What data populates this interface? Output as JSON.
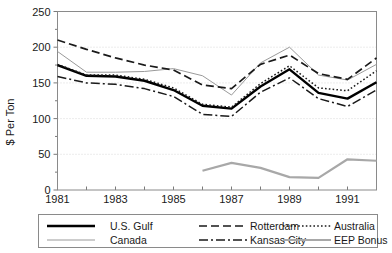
{
  "chart_data": {
    "type": "line",
    "title": "",
    "xlabel": "",
    "ylabel": "$ Per Ton",
    "xlim": [
      1981,
      1992
    ],
    "ylim": [
      0,
      250
    ],
    "yticks": [
      0,
      50,
      100,
      150,
      200,
      250
    ],
    "ytick_labels": [
      "0",
      "50",
      "100",
      "150",
      "200",
      "250"
    ],
    "xticks": [
      1981,
      1982,
      1983,
      1984,
      1985,
      1986,
      1987,
      1988,
      1989,
      1990,
      1991,
      1992
    ],
    "xtick_labels": [
      "1981",
      "",
      "1983",
      "",
      "1985",
      "",
      "1987",
      "",
      "1989",
      "",
      "1991",
      ""
    ],
    "grid": true,
    "grid_axis": "y",
    "legend_position": "bottom",
    "x": [
      1981,
      1982,
      1983,
      1984,
      1985,
      1986,
      1987,
      1988,
      1989,
      1990,
      1991,
      1992
    ],
    "series": [
      {
        "name": "U.S. Gulf",
        "style": "solid-thick",
        "color": "#000000",
        "width": 2.4,
        "dash": "none",
        "values": [
          175,
          160,
          159,
          153,
          140,
          118,
          114,
          145,
          169,
          136,
          128,
          151
        ]
      },
      {
        "name": "Canada",
        "style": "solid-thin",
        "color": "#9a9a9a",
        "width": 1.0,
        "dash": "none",
        "values": [
          194,
          165,
          165,
          166,
          170,
          160,
          133,
          178,
          200,
          161,
          154,
          176
        ]
      },
      {
        "name": "Rotterdam",
        "style": "dashed",
        "color": "#1a1a1a",
        "width": 1.7,
        "dash": "8 4",
        "values": [
          210,
          197,
          185,
          175,
          168,
          147,
          142,
          176,
          189,
          163,
          155,
          185
        ]
      },
      {
        "name": "Kansas City",
        "style": "dash-dot",
        "color": "#1a1a1a",
        "width": 1.5,
        "dash": "9 3 2 3",
        "values": [
          159,
          150,
          148,
          142,
          131,
          106,
          103,
          137,
          157,
          128,
          117,
          140
        ]
      },
      {
        "name": "Australia",
        "style": "dotted",
        "color": "#1a1a1a",
        "width": 1.5,
        "dash": "1.6 2.2",
        "values": [
          176,
          161,
          161,
          155,
          143,
          120,
          116,
          149,
          174,
          143,
          139,
          167
        ]
      },
      {
        "name": "EEP Bonus",
        "style": "solid-thick-gray",
        "color": "#a8a8a8",
        "width": 2.2,
        "dash": "none",
        "values": [
          null,
          null,
          null,
          null,
          null,
          27,
          38,
          31,
          18,
          17,
          43,
          41
        ]
      }
    ]
  },
  "legend": {
    "items": [
      {
        "label": "U.S. Gulf",
        "series": 0
      },
      {
        "label": "Rotterdam",
        "series": 2
      },
      {
        "label": "Australia",
        "series": 4
      },
      {
        "label": "Canada",
        "series": 1
      },
      {
        "label": "Kansas City",
        "series": 3
      },
      {
        "label": "EEP Bonus",
        "series": 5
      }
    ]
  }
}
